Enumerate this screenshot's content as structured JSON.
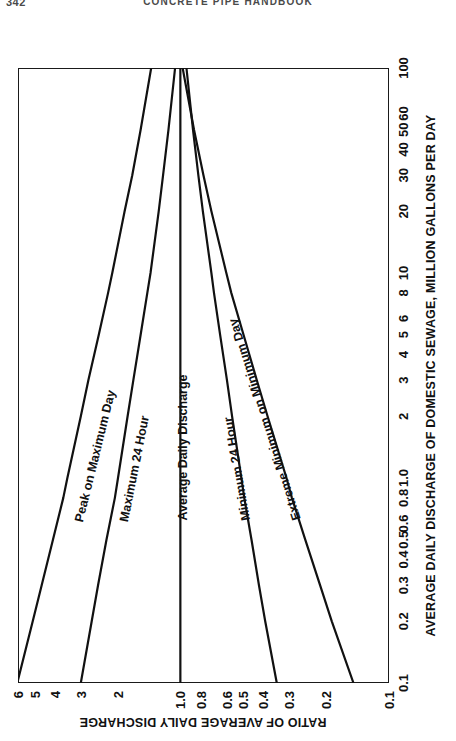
{
  "page": {
    "folio": "342",
    "running_head": "CONCRETE PIPE HANDBOOK"
  },
  "chart_data": {
    "type": "line",
    "title": "",
    "xlabel": "AVERAGE DAILY DISCHARGE OF DOMESTIC SEWAGE, MILLION GALLONS PER DAY",
    "ylabel": "RATIO OF AVERAGE DAILY DISCHARGE",
    "xscale": "log",
    "yscale": "log",
    "xlim": [
      0.1,
      100
    ],
    "ylim": [
      0.1,
      6
    ],
    "grid": true,
    "legend_position": "inline-on-curves",
    "x_ticks": [
      "0.1",
      "0.2",
      "0.3",
      "0.4",
      "0.5",
      "0.6",
      "0.8",
      "1.0",
      "2",
      "3",
      "4",
      "5",
      "6",
      "8",
      "10",
      "20",
      "30",
      "40",
      "50",
      "60",
      "100"
    ],
    "x_tick_values": [
      0.1,
      0.2,
      0.3,
      0.4,
      0.5,
      0.6,
      0.8,
      1.0,
      2,
      3,
      4,
      5,
      6,
      8,
      10,
      20,
      30,
      40,
      50,
      60,
      100
    ],
    "y_ticks": [
      "0.1",
      "0.2",
      "0.3",
      "0.4",
      "0.5",
      "0.6",
      "0.8",
      "1.0",
      "2",
      "3",
      "4",
      "5",
      "6"
    ],
    "y_tick_values": [
      0.1,
      0.2,
      0.3,
      0.4,
      0.5,
      0.6,
      0.8,
      1.0,
      2,
      3,
      4,
      5,
      6
    ],
    "series": [
      {
        "name": "Peak on Maximum Day",
        "label_anchor_x": 0.62,
        "label_anchor_y": 3.15,
        "x": [
          0.1,
          0.2,
          0.3,
          0.5,
          0.8,
          1.0,
          2,
          3,
          5,
          8,
          10,
          20,
          30,
          50,
          100
        ],
        "y": [
          6.05,
          5.1,
          4.62,
          4.08,
          3.64,
          3.48,
          3.0,
          2.76,
          2.46,
          2.22,
          2.12,
          1.85,
          1.7,
          1.55,
          1.38
        ]
      },
      {
        "name": "Maximum 24 Hour",
        "label_anchor_x": 0.62,
        "label_anchor_y": 1.92,
        "x": [
          0.1,
          0.2,
          0.3,
          0.5,
          0.8,
          1.0,
          2,
          3,
          5,
          8,
          10,
          20,
          30,
          50,
          100
        ],
        "y": [
          3.0,
          2.66,
          2.48,
          2.26,
          2.06,
          1.99,
          1.79,
          1.68,
          1.55,
          1.44,
          1.39,
          1.27,
          1.21,
          1.14,
          1.06
        ]
      },
      {
        "name": "Average Daily Discharge",
        "label_anchor_x": 0.62,
        "label_anchor_y": 1.0,
        "x": [
          0.1,
          100
        ],
        "y": [
          1.0,
          1.0
        ]
      },
      {
        "name": "Minimum 24 Hour",
        "label_anchor_x": 0.62,
        "label_anchor_y": 0.5,
        "x": [
          0.1,
          0.2,
          0.3,
          0.5,
          0.8,
          1.0,
          2,
          3,
          5,
          8,
          10,
          20,
          30,
          50,
          100
        ],
        "y": [
          0.345,
          0.392,
          0.42,
          0.456,
          0.494,
          0.51,
          0.565,
          0.598,
          0.645,
          0.69,
          0.71,
          0.78,
          0.82,
          0.87,
          0.935
        ]
      },
      {
        "name": "Extreme Minimum on Minimum Day",
        "label_anchor_x": 0.62,
        "label_anchor_y": 0.285,
        "x": [
          0.1,
          0.2,
          0.3,
          0.5,
          0.8,
          1.0,
          2,
          3,
          5,
          8,
          10,
          20,
          30,
          50,
          100
        ],
        "y": [
          0.148,
          0.188,
          0.214,
          0.252,
          0.292,
          0.31,
          0.382,
          0.43,
          0.498,
          0.57,
          0.602,
          0.71,
          0.775,
          0.86,
          0.975
        ]
      }
    ]
  }
}
